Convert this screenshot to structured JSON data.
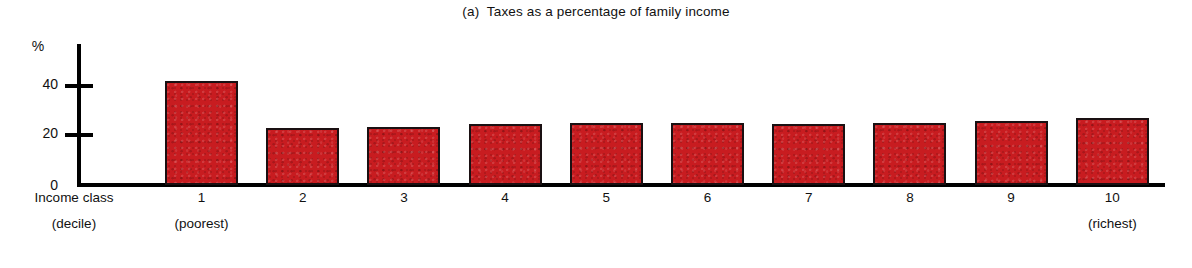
{
  "chart_data": {
    "type": "bar",
    "title": "(a)  Taxes as a percentage of family income",
    "xlabel_line1": "Income class",
    "xlabel_line2": "(decile)",
    "ylabel": "%",
    "ylim": [
      0,
      50
    ],
    "yticks": [
      "0",
      "20",
      "40"
    ],
    "grid": false,
    "legend": "none",
    "bar_color": "#c81c20",
    "bar_edge_color": "#1a1012",
    "categories": [
      "1",
      "2",
      "3",
      "4",
      "5",
      "6",
      "7",
      "8",
      "9",
      "10"
    ],
    "category_notes": [
      "(poorest)",
      "",
      "",
      "",
      "",
      "",
      "",
      "",
      "",
      "(richest)"
    ],
    "values": [
      42,
      23,
      23.5,
      24.5,
      25,
      25,
      24.5,
      25,
      26,
      27
    ]
  },
  "title": {
    "text": "(a)  Taxes as a percentage of family income"
  },
  "y_axis": {
    "unit_label": "%",
    "tick_40": "40",
    "tick_20": "20",
    "tick_0": "0"
  },
  "x_axis": {
    "caption_line1": "Income class",
    "caption_line2": "(decile)",
    "labels": [
      {
        "num": "1",
        "sub": "(poorest)"
      },
      {
        "num": "2",
        "sub": ""
      },
      {
        "num": "3",
        "sub": ""
      },
      {
        "num": "4",
        "sub": ""
      },
      {
        "num": "5",
        "sub": ""
      },
      {
        "num": "6",
        "sub": ""
      },
      {
        "num": "7",
        "sub": ""
      },
      {
        "num": "8",
        "sub": ""
      },
      {
        "num": "9",
        "sub": ""
      },
      {
        "num": "10",
        "sub": "(richest)"
      }
    ]
  }
}
